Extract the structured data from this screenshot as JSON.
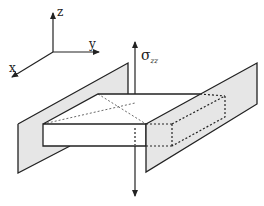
{
  "diagram": {
    "axes": {
      "x_label": "x",
      "y_label": "y",
      "z_label": "z"
    },
    "stress_label": {
      "symbol": "σ",
      "subscript": "zz"
    },
    "colors": {
      "line": "#222222",
      "plate_fill": "#e6e6e6",
      "background": "#ffffff"
    }
  }
}
